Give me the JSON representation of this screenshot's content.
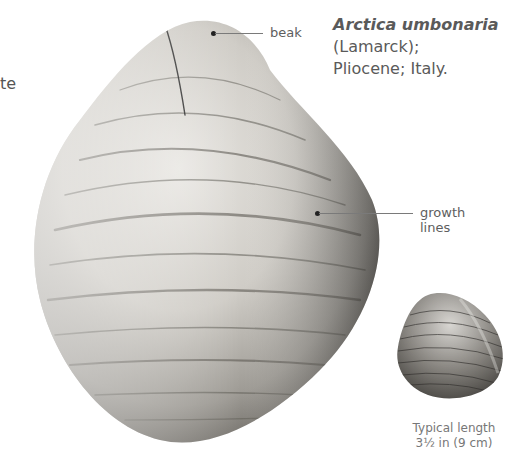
{
  "partial_left_text": "te",
  "species": {
    "name": "Arctica umbonaria",
    "authority": "(Lamarck);",
    "age_location": "Pliocene; Italy."
  },
  "annotations": {
    "beak": "beak",
    "growth_lines_1": "growth",
    "growth_lines_2": "lines"
  },
  "caption": {
    "line1": "Typical length",
    "line2": "3½ in (9 cm)"
  },
  "colors": {
    "text": "#5a5a5a",
    "leader_line": "#7a7a7a",
    "background": "#ffffff"
  }
}
